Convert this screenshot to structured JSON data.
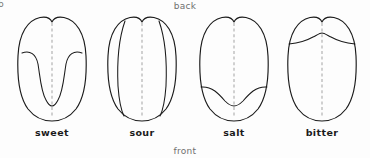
{
  "figure": {
    "corner_mark": "b",
    "orientation": {
      "back_label": "back",
      "front_label": "front"
    },
    "colors": {
      "background": "#fdfdfd",
      "outline": "#1a1a1a",
      "midline": "#a8a8a8",
      "label_text": "#1b1b1b",
      "orientation_text": "#6f6f6f"
    },
    "diagrams": [
      {
        "label": "sweet",
        "region_name": "tip-u-shaped-zone",
        "region_description": "U-shaped band following the front tip and lateral edges"
      },
      {
        "label": "sour",
        "region_name": "lateral-side-strips",
        "region_description": "Two vertical strips along the left and right sides"
      },
      {
        "label": "salt",
        "region_name": "front-curved-band",
        "region_description": "Curved band across the front lower portion"
      },
      {
        "label": "bitter",
        "region_name": "back-curved-band",
        "region_description": "Curved band across the back upper portion"
      }
    ]
  }
}
